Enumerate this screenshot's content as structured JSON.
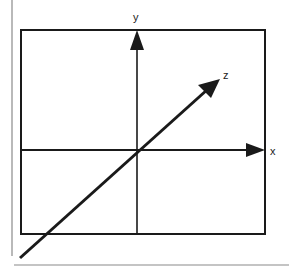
{
  "diagram": {
    "axes": {
      "x": {
        "label": "x"
      },
      "y": {
        "label": "y"
      },
      "z": {
        "label": "z"
      }
    },
    "colors": {
      "stroke": "#1a1a1a",
      "border": "#888888",
      "background": "#ffffff"
    }
  }
}
